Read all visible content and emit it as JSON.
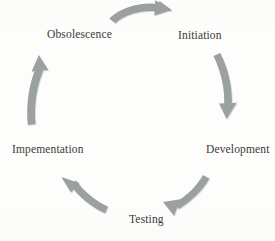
{
  "diagram": {
    "type": "cycle",
    "direction": "clockwise",
    "background_color": "#fdfdfc",
    "arrow_color": "#9ba0a0",
    "arrow_shadow_color": "#b9bdbd",
    "label_color": "#3b3a38",
    "stages": [
      {
        "id": "initiation",
        "label": "Initiation",
        "position": "top-right",
        "order": 1
      },
      {
        "id": "development",
        "label": "Development",
        "position": "right",
        "order": 2
      },
      {
        "id": "testing",
        "label": "Testing",
        "position": "bottom",
        "order": 3
      },
      {
        "id": "impementation",
        "label": "Impementation",
        "position": "left",
        "order": 4
      },
      {
        "id": "obsolescence",
        "label": "Obsolescence",
        "position": "top-left",
        "order": 5
      }
    ],
    "arrows": [
      {
        "id": "arrow-obsolescence-to-initiation",
        "from": "obsolescence",
        "to": "initiation",
        "icon": "curved-arrow-right-icon",
        "position": "top"
      },
      {
        "id": "arrow-initiation-to-development",
        "from": "initiation",
        "to": "development",
        "icon": "curved-arrow-down-icon",
        "position": "right"
      },
      {
        "id": "arrow-development-to-testing",
        "from": "development",
        "to": "testing",
        "icon": "curved-arrow-down-left-icon",
        "position": "bottom-right"
      },
      {
        "id": "arrow-testing-to-impementation",
        "from": "testing",
        "to": "impementation",
        "icon": "curved-arrow-up-left-icon",
        "position": "bottom-left"
      },
      {
        "id": "arrow-impementation-to-obsolescence",
        "from": "impementation",
        "to": "obsolescence",
        "icon": "curved-arrow-up-icon",
        "position": "left"
      }
    ]
  }
}
